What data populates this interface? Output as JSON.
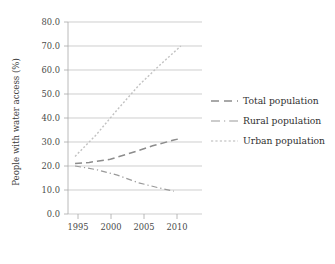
{
  "chart_data": {
    "type": "line",
    "title": "",
    "subtitle": "",
    "xlabel": "",
    "ylabel": "People with water access (%)",
    "xlim": [
      1994,
      2013
    ],
    "ylim": [
      0,
      80
    ],
    "grid": true,
    "grid_axis": "y",
    "legend_position": "right",
    "x_ticks": [
      1995,
      2000,
      2005,
      2010
    ],
    "x_tick_labels": [
      "1995",
      "2000",
      "2005",
      "2010"
    ],
    "y_ticks": [
      0,
      10,
      20,
      30,
      40,
      50,
      60,
      70,
      80
    ],
    "y_tick_labels": [
      "0.0",
      "10.0",
      "20.0",
      "30.0",
      "40.0",
      "50.0",
      "60.0",
      "70.0",
      "80.0"
    ],
    "series": [
      {
        "name": "Total population",
        "style": "dashed",
        "color": "#8c8c8c",
        "x": [
          1995,
          1997,
          2000,
          2003,
          2006,
          2009,
          2010
        ],
        "values": [
          21.0,
          21.5,
          22.8,
          25.5,
          28.4,
          30.8,
          31.5
        ]
      },
      {
        "name": "Rural population",
        "style": "dash-dot",
        "color": "#9a9a9a",
        "x": [
          1995,
          1998,
          2001,
          2004,
          2007,
          2009
        ],
        "values": [
          20.0,
          18.5,
          16.2,
          13.0,
          10.8,
          9.5
        ]
      },
      {
        "name": "Urban population",
        "style": "dotted",
        "color": "#c2c2c2",
        "x": [
          1995,
          1998,
          2001,
          2004,
          2007,
          2010
        ],
        "values": [
          24.0,
          33.0,
          43.5,
          53.5,
          62.0,
          70.0
        ]
      }
    ]
  },
  "axes": {
    "y_axis_title": "People with water access (%)",
    "y_tick_0": "0.0",
    "y_tick_10": "10.0",
    "y_tick_20": "20.0",
    "y_tick_30": "30.0",
    "y_tick_40": "40.0",
    "y_tick_50": "50.0",
    "y_tick_60": "60.0",
    "y_tick_70": "70.0",
    "y_tick_80": "80.0",
    "x_tick_1995": "1995",
    "x_tick_2000": "2000",
    "x_tick_2005": "2005",
    "x_tick_2010": "2010"
  },
  "legend": {
    "entries": [
      {
        "label": "Total population",
        "swatch": "dashed-line-swatch"
      },
      {
        "label": "Rural population",
        "swatch": "dash-dot-line-swatch"
      },
      {
        "label": "Urban population",
        "swatch": "dotted-line-swatch"
      }
    ],
    "entry_0_label": "Total population",
    "entry_1_label": "Rural population",
    "entry_2_label": "Urban population"
  },
  "colors": {
    "grid": "#b9b9b9",
    "axis": "#a8a8a8",
    "total": "#8c8c8c",
    "rural": "#9a9a9a",
    "urban": "#c2c2c2",
    "text": "#3a3a3a",
    "background": "#ffffff"
  }
}
